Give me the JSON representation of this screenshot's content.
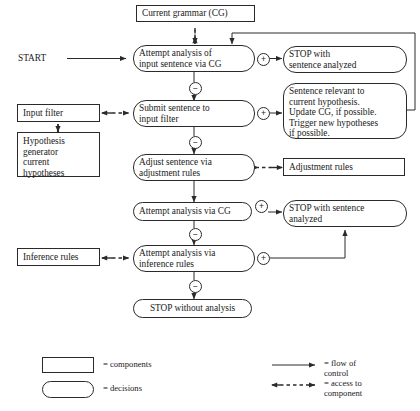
{
  "diagram": {
    "title_text": "",
    "start_label": "START",
    "nodes": {
      "current_grammar": "Current grammar (CG)",
      "attempt_analysis_cg": "Attempt analysis of\ninput sentence via CG",
      "stop_sentence_analyzed_1": "STOP with\nsentence analyzed",
      "input_filter": "Input filter",
      "hypothesis_generator": "Hypothesis\ngenerator\n     current\n     hypotheses",
      "submit_sentence": "Submit sentence to\ninput filter",
      "sentence_relevant": "Sentence relevant to\ncurrent hypothesis.\nUpdate CG, if possible.\nTrigger new hypotheses\nif possible.",
      "adjust_sentence": "Adjust sentence via\nadjustment rules",
      "adjustment_rules": "Adjustment rules",
      "attempt_analysis_via_cg": "Attempt analysis via CG",
      "stop_sentence_analyzed_2": "STOP with sentence\nanalyzed",
      "inference_rules": "Inference rules",
      "attempt_analysis_inference": "Attempt analysis via\ninference rules",
      "stop_without_analysis": "STOP without analysis"
    },
    "signs": {
      "plus": "+",
      "minus": "−"
    },
    "legend": {
      "components_label": "= components",
      "decisions_label": "= decisions",
      "flow_label": "= flow of\n   control",
      "access_label": "= access to\n   component"
    },
    "colors": {
      "stroke": "#2a2a2a",
      "text": "#1a1a1a",
      "background": "#ffffff"
    }
  }
}
